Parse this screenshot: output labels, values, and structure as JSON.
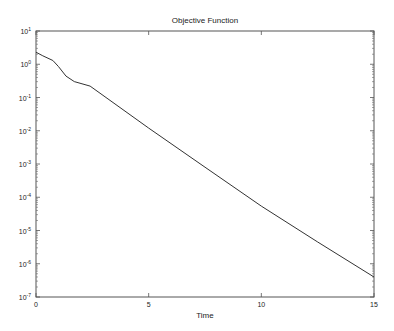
{
  "chart_data": {
    "type": "line",
    "title": "Objective Function",
    "xlabel": "Time",
    "ylabel": "",
    "xscale": "linear",
    "yscale": "log",
    "xlim": [
      0,
      15
    ],
    "ylim": [
      1e-07,
      10
    ],
    "xticks": [
      0,
      5,
      10,
      15
    ],
    "xtick_labels": [
      "0",
      "5",
      "10",
      "15"
    ],
    "yticks_exp": [
      1,
      0,
      -1,
      -2,
      -3,
      -4,
      -5,
      -6,
      -7
    ],
    "grid": false,
    "legend": null,
    "series": [
      {
        "name": "objective",
        "color": "#333333",
        "x": [
          0,
          0.3,
          0.75,
          1.0,
          1.33,
          1.7,
          2.4,
          5,
          7.5,
          10,
          12.5,
          15
        ],
        "values": [
          2.3,
          1.8,
          1.3,
          0.85,
          0.44,
          0.3,
          0.22,
          0.012,
          0.0008,
          5.4e-05,
          4.5e-06,
          4e-07
        ]
      }
    ]
  }
}
